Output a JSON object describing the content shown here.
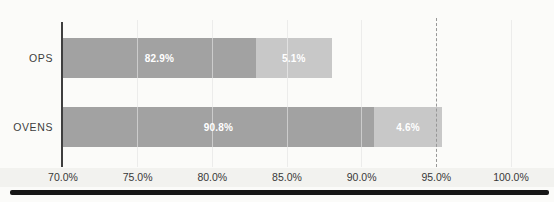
{
  "chart_data": {
    "type": "bar",
    "orientation": "horizontal",
    "stacked": true,
    "title": "",
    "xlabel": "",
    "ylabel": "",
    "categories": [
      "OPS",
      "OVENS"
    ],
    "series": [
      {
        "name": "primary-segment",
        "color": "#a2a2a2",
        "values": [
          82.9,
          90.8
        ],
        "labels": [
          "82.9%",
          "90.8%"
        ]
      },
      {
        "name": "secondary-segment",
        "color": "#c8c8c8",
        "values": [
          5.1,
          4.6
        ],
        "labels": [
          "5.1%",
          "4.6%"
        ]
      }
    ],
    "xlim": [
      70,
      100
    ],
    "x_ticks": [
      {
        "value": 70,
        "label": "70.0%"
      },
      {
        "value": 75,
        "label": "75.0%"
      },
      {
        "value": 80,
        "label": "80.0%"
      },
      {
        "value": 85,
        "label": "85.0%"
      },
      {
        "value": 90,
        "label": "90.0%"
      },
      {
        "value": 95,
        "label": "95.0%"
      },
      {
        "value": 100,
        "label": "100.0%"
      }
    ],
    "reference_line": {
      "value": 95,
      "style": "dashed",
      "color": "#979797"
    },
    "grid": true,
    "legend": "none",
    "bar_label_color": "#ffffff",
    "axis_color": "#3f3f3f"
  }
}
